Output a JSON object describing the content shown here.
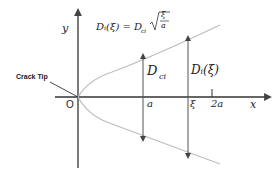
{
  "diagram": {
    "formula": {
      "lhs": "Dᵢ(ξ) = D",
      "sub": "ci",
      "frac_num": "ξ",
      "frac_den": "a"
    },
    "axis_labels": {
      "y": "y",
      "x": "x",
      "origin": "O"
    },
    "ticks": {
      "a": "a",
      "xi": "ξ",
      "two_a": "2a"
    },
    "annotations": {
      "crack_tip": "Crack Tip",
      "dci_main": "D",
      "dci_sub": "ci",
      "di_xi": "Dᵢ(ξ)"
    },
    "colors": {
      "axis": "#333333",
      "curve": "#b8b8b8",
      "arrow": "#555555"
    }
  }
}
